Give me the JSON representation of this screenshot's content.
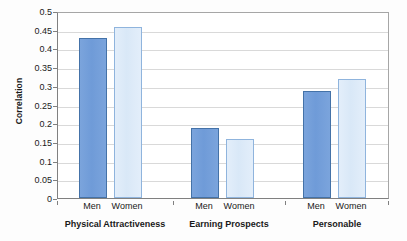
{
  "chart_data": {
    "type": "bar",
    "title": "",
    "subtitle": "",
    "xlabel": "",
    "ylabel": "Correlation",
    "ylim": [
      0,
      0.5
    ],
    "ytick_step": 0.05,
    "yticks": [
      "0.5",
      "0.45",
      "0.4",
      "0.35",
      "0.3",
      "0.25",
      "0.2",
      "0.15",
      "0.1",
      "0.05",
      "0"
    ],
    "ytick_values": [
      0.5,
      0.45,
      0.4,
      0.35,
      0.3,
      0.25,
      0.2,
      0.15,
      0.1,
      0.05,
      0
    ],
    "grid": "horizontal",
    "legend": "none",
    "categories": [
      "Physical Attractiveness",
      "Earning Prospects",
      "Personable"
    ],
    "subcategories": [
      "Men",
      "Women"
    ],
    "series": [
      {
        "name": "Men",
        "color": "#7ba4dc",
        "values": [
          0.428,
          0.188,
          0.287
        ]
      },
      {
        "name": "Women",
        "color": "#dae8f7",
        "values": [
          0.458,
          0.158,
          0.317
        ]
      }
    ],
    "bars": [
      {
        "group": "Physical Attractiveness",
        "subcategory": "Men",
        "value": 0.428,
        "series": "men"
      },
      {
        "group": "Physical Attractiveness",
        "subcategory": "Women",
        "value": 0.458,
        "series": "women"
      },
      {
        "group": "Earning Prospects",
        "subcategory": "Men",
        "value": 0.188,
        "series": "men"
      },
      {
        "group": "Earning Prospects",
        "subcategory": "Women",
        "value": 0.158,
        "series": "women"
      },
      {
        "group": "Personable",
        "subcategory": "Men",
        "value": 0.287,
        "series": "men"
      },
      {
        "group": "Personable",
        "subcategory": "Women",
        "value": 0.317,
        "series": "women"
      }
    ]
  },
  "colors": {
    "men_fill": "#7ba4dc",
    "men_border": "#4472a8",
    "women_fill": "#dae8f7",
    "women_border": "#8fb4dd",
    "gridline": "#d9d9d9",
    "axis": "#808080",
    "text": "#1a1a1a",
    "plot_background": "#ffffff"
  }
}
